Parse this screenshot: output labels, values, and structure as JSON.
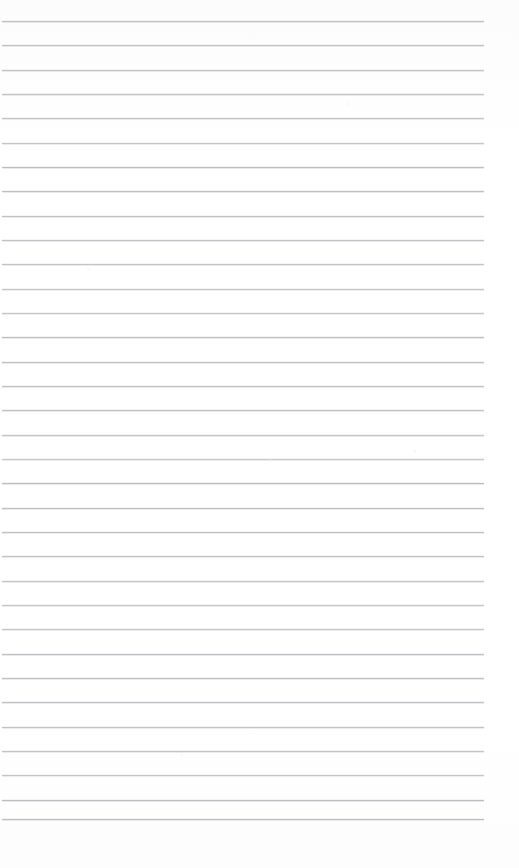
{
  "document": {
    "kind": "scanned-lined-paper",
    "title": "",
    "body_text": "",
    "visible_text": "",
    "page_number": "",
    "annotations": []
  },
  "canvas": {
    "width": 519,
    "height": 868,
    "background_color": "#fefefe"
  },
  "ruling": {
    "style": "wide-ruled horizontal lines",
    "line_color": "#b9bdc1",
    "line_halo_color": "#dfe2e4",
    "line_thickness_px": 1,
    "line_count": 33,
    "first_line_y": 21,
    "line_spacing_px": 24.3,
    "last_line_y": 819,
    "line_start_x": 2,
    "line_end_x": 484,
    "line_length_px": 482,
    "right_margin_px": 35,
    "bottom_margin_px": 49,
    "vertical_margin_rule": "none",
    "holes": "none"
  },
  "lines": [
    {
      "index": 1,
      "y": 21,
      "x1": 2,
      "x2": 484,
      "content": ""
    },
    {
      "index": 2,
      "y": 45,
      "x1": 2,
      "x2": 484,
      "content": ""
    },
    {
      "index": 3,
      "y": 70,
      "x1": 2,
      "x2": 484,
      "content": ""
    },
    {
      "index": 4,
      "y": 94,
      "x1": 2,
      "x2": 484,
      "content": ""
    },
    {
      "index": 5,
      "y": 118,
      "x1": 2,
      "x2": 484,
      "content": ""
    },
    {
      "index": 6,
      "y": 143,
      "x1": 2,
      "x2": 484,
      "content": ""
    },
    {
      "index": 7,
      "y": 167,
      "x1": 2,
      "x2": 484,
      "content": ""
    },
    {
      "index": 8,
      "y": 191,
      "x1": 2,
      "x2": 484,
      "content": ""
    },
    {
      "index": 9,
      "y": 216,
      "x1": 2,
      "x2": 484,
      "content": ""
    },
    {
      "index": 10,
      "y": 240,
      "x1": 2,
      "x2": 484,
      "content": ""
    },
    {
      "index": 11,
      "y": 264,
      "x1": 2,
      "x2": 484,
      "content": ""
    },
    {
      "index": 12,
      "y": 289,
      "x1": 2,
      "x2": 484,
      "content": ""
    },
    {
      "index": 13,
      "y": 313,
      "x1": 2,
      "x2": 484,
      "content": ""
    },
    {
      "index": 14,
      "y": 337,
      "x1": 2,
      "x2": 484,
      "content": ""
    },
    {
      "index": 15,
      "y": 362,
      "x1": 2,
      "x2": 484,
      "content": ""
    },
    {
      "index": 16,
      "y": 386,
      "x1": 2,
      "x2": 484,
      "content": ""
    },
    {
      "index": 17,
      "y": 410,
      "x1": 2,
      "x2": 484,
      "content": ""
    },
    {
      "index": 18,
      "y": 435,
      "x1": 2,
      "x2": 484,
      "content": ""
    },
    {
      "index": 19,
      "y": 459,
      "x1": 2,
      "x2": 484,
      "content": ""
    },
    {
      "index": 20,
      "y": 483,
      "x1": 2,
      "x2": 484,
      "content": ""
    },
    {
      "index": 21,
      "y": 508,
      "x1": 2,
      "x2": 484,
      "content": ""
    },
    {
      "index": 22,
      "y": 532,
      "x1": 2,
      "x2": 484,
      "content": ""
    },
    {
      "index": 23,
      "y": 556,
      "x1": 2,
      "x2": 484,
      "content": ""
    },
    {
      "index": 24,
      "y": 581,
      "x1": 2,
      "x2": 484,
      "content": ""
    },
    {
      "index": 25,
      "y": 605,
      "x1": 2,
      "x2": 484,
      "content": ""
    },
    {
      "index": 26,
      "y": 629,
      "x1": 2,
      "x2": 484,
      "content": ""
    },
    {
      "index": 27,
      "y": 654,
      "x1": 2,
      "x2": 484,
      "content": ""
    },
    {
      "index": 28,
      "y": 678,
      "x1": 2,
      "x2": 484,
      "content": ""
    },
    {
      "index": 29,
      "y": 702,
      "x1": 2,
      "x2": 484,
      "content": ""
    },
    {
      "index": 30,
      "y": 727,
      "x1": 2,
      "x2": 484,
      "content": ""
    },
    {
      "index": 31,
      "y": 751,
      "x1": 2,
      "x2": 484,
      "content": ""
    },
    {
      "index": 32,
      "y": 775,
      "x1": 2,
      "x2": 484,
      "content": ""
    },
    {
      "index": 33,
      "y": 800,
      "x1": 2,
      "x2": 484,
      "content": ""
    },
    {
      "index": 34,
      "y": 819,
      "x1": 2,
      "x2": 484,
      "content": ""
    }
  ]
}
